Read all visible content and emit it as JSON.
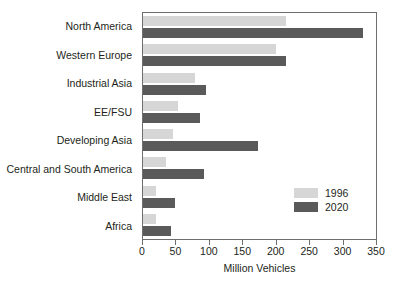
{
  "chart_data": {
    "type": "bar",
    "orientation": "horizontal",
    "title": "",
    "subtitle": "",
    "xlabel": "Million Vehicles",
    "ylabel": "",
    "xlim": [
      0,
      350
    ],
    "xticks": [
      0,
      50,
      100,
      150,
      200,
      250,
      300,
      350
    ],
    "xtick_labels": [
      "0",
      "50",
      "100",
      "150",
      "200",
      "250",
      "300",
      "350"
    ],
    "grid": false,
    "legend_position": "inner-bottom-right",
    "categories": [
      "North America",
      "Western Europe",
      "Industrial Asia",
      "EE/FSU",
      "Developing Asia",
      "Central and South America",
      "Middle East",
      "Africa"
    ],
    "series": [
      {
        "name": "1996",
        "color": "#d6d6d6",
        "values": [
          215,
          200,
          78,
          52,
          45,
          35,
          20,
          20
        ]
      },
      {
        "name": "2020",
        "color": "#5a5a5a",
        "values": [
          330,
          215,
          95,
          85,
          172,
          92,
          48,
          42
        ]
      }
    ]
  },
  "legend": {
    "entries": [
      {
        "label": "1996",
        "color": "#d6d6d6"
      },
      {
        "label": "2020",
        "color": "#5a5a5a"
      }
    ]
  },
  "colors": {
    "series_1996": "#d6d6d6",
    "series_2020": "#5a5a5a",
    "axis": "#6f6f6f",
    "text": "#231f20",
    "background": "#ffffff"
  }
}
